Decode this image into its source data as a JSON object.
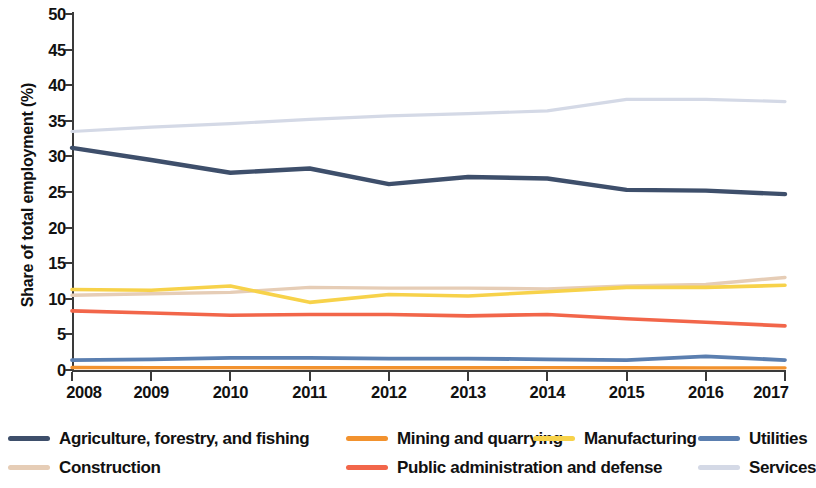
{
  "chart_data": {
    "type": "line",
    "title": "",
    "xlabel": "",
    "ylabel": "Share of total employment (%)",
    "x": [
      2008,
      2009,
      2010,
      2011,
      2012,
      2013,
      2014,
      2015,
      2016,
      2017
    ],
    "xtick_labels": [
      "2008",
      "2009",
      "2010",
      "2011",
      "2012",
      "2013",
      "2014",
      "2015",
      "2016",
      "2017"
    ],
    "ytick_labels": [
      "50",
      "45",
      "40",
      "35",
      "30",
      "25",
      "20",
      "15",
      "10",
      "5",
      "0"
    ],
    "ytick_values": [
      50,
      45,
      40,
      35,
      30,
      25,
      20,
      15,
      10,
      5,
      0
    ],
    "ylim": [
      0,
      50
    ],
    "xlim": [
      2008,
      2017
    ],
    "grid": false,
    "legend_position": "bottom",
    "series": [
      {
        "name": "Agriculture, forestry, and fishing",
        "color": "#3e4f6b",
        "values": [
          31.2,
          29.5,
          27.7,
          28.3,
          26.1,
          27.1,
          26.9,
          25.3,
          25.2,
          24.7
        ]
      },
      {
        "name": "Mining and quarrying",
        "color": "#f2922e",
        "values": [
          0.35,
          0.33,
          0.33,
          0.32,
          0.31,
          0.32,
          0.33,
          0.31,
          0.3,
          0.3
        ]
      },
      {
        "name": "Manufacturing",
        "color": "#f7d24a",
        "values": [
          11.3,
          11.2,
          11.8,
          9.5,
          10.6,
          10.4,
          11.0,
          11.6,
          11.6,
          11.9
        ]
      },
      {
        "name": "Utilities",
        "color": "#5b7fb0",
        "values": [
          1.4,
          1.5,
          1.7,
          1.7,
          1.6,
          1.6,
          1.5,
          1.4,
          1.9,
          1.4
        ]
      },
      {
        "name": "Construction",
        "color": "#e6cdb6",
        "values": [
          10.5,
          10.7,
          10.9,
          11.6,
          11.5,
          11.5,
          11.4,
          11.8,
          12.0,
          13.0
        ]
      },
      {
        "name": "Public administration and defense",
        "color": "#f2664a",
        "values": [
          8.3,
          8.0,
          7.7,
          7.8,
          7.8,
          7.6,
          7.8,
          7.2,
          6.7,
          6.2
        ]
      },
      {
        "name": "Services",
        "color": "#d4d9e6",
        "values": [
          33.5,
          34.1,
          34.6,
          35.2,
          35.7,
          36.0,
          36.4,
          38.0,
          38.0,
          37.7
        ]
      }
    ]
  },
  "legend": {
    "items": [
      {
        "label": "Agriculture, forestry, and fishing",
        "color": "#3e4f6b"
      },
      {
        "label": "Mining and quarrying",
        "color": "#f2922e"
      },
      {
        "label": "Manufacturing",
        "color": "#f7d24a"
      },
      {
        "label": "Utilities",
        "color": "#5b7fb0"
      },
      {
        "label": "Construction",
        "color": "#e6cdb6"
      },
      {
        "label": "Public administration and defense",
        "color": "#f2664a"
      },
      {
        "label": "Services",
        "color": "#d4d9e6"
      }
    ]
  }
}
